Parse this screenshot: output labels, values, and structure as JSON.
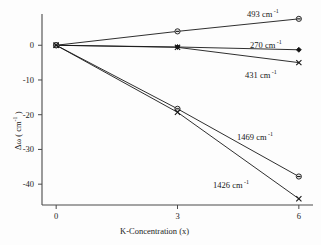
{
  "chart_data": {
    "type": "line",
    "title": "",
    "xlabel": "K-Concentration (x)",
    "ylabel": "Δω ( cm",
    "ylabel_sup": "-1",
    "ylabel_tail": " )",
    "x": [
      0,
      3,
      6
    ],
    "xlim": [
      -0.35,
      6.35
    ],
    "ylim": [
      -46,
      9
    ],
    "xticks": [
      "0",
      "3",
      "6"
    ],
    "xtick_values": [
      0,
      3,
      6
    ],
    "yticks": [
      "0",
      "-10",
      "-20",
      "-30",
      "-40"
    ],
    "ytick_values": [
      0,
      -10,
      -20,
      -30,
      -40
    ],
    "grid": false,
    "legend_position": "inline-annotations",
    "series": [
      {
        "name": "493 cm-1",
        "label": "493 cm",
        "label_sup": "-1",
        "marker": "circle-open",
        "values": [
          0,
          4.0,
          7.6
        ]
      },
      {
        "name": "270 cm-1",
        "label": "270 cm",
        "label_sup": "-1",
        "marker": "diamond-filled",
        "values": [
          0,
          -0.5,
          -1.3
        ]
      },
      {
        "name": "431 cm-1",
        "label": "431 cm",
        "label_sup": "-1",
        "marker": "x-cross",
        "values": [
          0,
          -0.6,
          -5.0
        ]
      },
      {
        "name": "1469 cm-1",
        "label": "1469 cm",
        "label_sup": "-1",
        "marker": "circle-open",
        "values": [
          0,
          -18.3,
          -37.8
        ]
      },
      {
        "name": "1426 cm-1",
        "label": "1426 cm",
        "label_sup": "-1",
        "marker": "x-cross",
        "values": [
          0,
          -19.3,
          -44.2
        ]
      }
    ],
    "annotations": [
      {
        "text": "493 cm",
        "sup": "-1",
        "x": 247,
        "y": 8
      },
      {
        "text": "270 cm",
        "sup": "-1",
        "x": 250,
        "y": 39
      },
      {
        "text": "431 cm",
        "sup": "-1",
        "x": 245,
        "y": 69
      },
      {
        "text": "1469 cm",
        "sup": "-1",
        "x": 237,
        "y": 131
      },
      {
        "text": "1426 cm",
        "sup": "-1",
        "x": 213,
        "y": 179
      }
    ]
  },
  "colors": {
    "line": "#171717",
    "axis": "#4a4a4a",
    "background": "#fdfdfd",
    "marker_fill": "#e9e9e9"
  }
}
